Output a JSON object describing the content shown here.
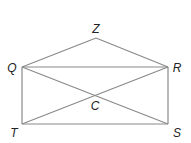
{
  "diagram": {
    "type": "geometry",
    "line_color": "#8a8a8a",
    "label_color": "#222222",
    "points": {
      "Z": {
        "label": "Z",
        "x": 96,
        "y": 38,
        "lx": 96,
        "ly": 33
      },
      "Q": {
        "label": "Q",
        "x": 22,
        "y": 67,
        "lx": 12,
        "ly": 72
      },
      "R": {
        "label": "R",
        "x": 168,
        "y": 67,
        "lx": 177,
        "ly": 72
      },
      "T": {
        "label": "T",
        "x": 22,
        "y": 124,
        "lx": 14,
        "ly": 137
      },
      "S": {
        "label": "S",
        "x": 168,
        "y": 124,
        "lx": 177,
        "ly": 137
      },
      "C": {
        "label": "C",
        "x": 95,
        "y": 95.5,
        "lx": 95,
        "ly": 110
      }
    },
    "segments": [
      [
        "Q",
        "Z"
      ],
      [
        "Z",
        "R"
      ],
      [
        "Q",
        "R"
      ],
      [
        "Q",
        "T"
      ],
      [
        "R",
        "S"
      ],
      [
        "T",
        "S"
      ],
      [
        "Q",
        "S"
      ],
      [
        "T",
        "R"
      ]
    ]
  }
}
